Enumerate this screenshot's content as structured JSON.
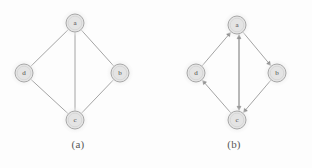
{
  "figure": {
    "background_color": "#fdfdfd",
    "edge_color": "#9a9a9a",
    "node_fill": "#e4e4e4",
    "node_stroke": "#a8a8a8",
    "label_color": "#4a4a4a",
    "node_radius": 9,
    "halo_color": "#efefef"
  },
  "panels": [
    {
      "id": "a",
      "caption": "(a)",
      "graph_type": "undirected",
      "nodes": [
        {
          "id": "a",
          "label": "a",
          "x": 75,
          "y": 23
        },
        {
          "id": "d",
          "label": "d",
          "x": 24,
          "y": 73
        },
        {
          "id": "b",
          "label": "b",
          "x": 120,
          "y": 73
        },
        {
          "id": "c",
          "label": "c",
          "x": 75,
          "y": 120
        }
      ],
      "edges": [
        {
          "from": "a",
          "to": "d",
          "directed": false
        },
        {
          "from": "a",
          "to": "b",
          "directed": false
        },
        {
          "from": "a",
          "to": "c",
          "directed": false
        },
        {
          "from": "d",
          "to": "c",
          "directed": false
        },
        {
          "from": "b",
          "to": "c",
          "directed": false
        }
      ]
    },
    {
      "id": "b",
      "caption": "(b)",
      "graph_type": "directed",
      "nodes": [
        {
          "id": "a",
          "label": "a",
          "x": 81,
          "y": 25
        },
        {
          "id": "d",
          "label": "d",
          "x": 40,
          "y": 73
        },
        {
          "id": "b",
          "label": "b",
          "x": 121,
          "y": 73
        },
        {
          "id": "c",
          "label": "c",
          "x": 81,
          "y": 120
        }
      ],
      "edges": [
        {
          "from": "d",
          "to": "a",
          "directed": true,
          "offset": 0
        },
        {
          "from": "a",
          "to": "b",
          "directed": true,
          "offset": 0
        },
        {
          "from": "a",
          "to": "c",
          "directed": true,
          "offset": -2
        },
        {
          "from": "c",
          "to": "a",
          "directed": true,
          "offset": 2
        },
        {
          "from": "c",
          "to": "d",
          "directed": true,
          "offset": 0
        },
        {
          "from": "b",
          "to": "c",
          "directed": true,
          "offset": 0
        }
      ]
    }
  ]
}
